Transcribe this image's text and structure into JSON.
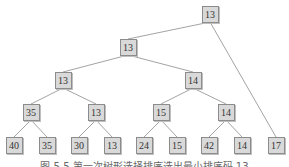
{
  "diagram": {
    "type": "tournament-tree",
    "nodes": [
      {
        "id": "root",
        "label": "13",
        "x": 210,
        "y": 14
      },
      {
        "id": "n1",
        "label": "13",
        "x": 128,
        "y": 47
      },
      {
        "id": "n2",
        "label": "13",
        "x": 63,
        "y": 80
      },
      {
        "id": "n3",
        "label": "14",
        "x": 193,
        "y": 80
      },
      {
        "id": "n4",
        "label": "35",
        "x": 31,
        "y": 112
      },
      {
        "id": "n5",
        "label": "13",
        "x": 96,
        "y": 112
      },
      {
        "id": "n6",
        "label": "15",
        "x": 161,
        "y": 112
      },
      {
        "id": "n7",
        "label": "14",
        "x": 226,
        "y": 112
      },
      {
        "id": "l1",
        "label": "40",
        "x": 14,
        "y": 145
      },
      {
        "id": "l2",
        "label": "35",
        "x": 47,
        "y": 145
      },
      {
        "id": "l3",
        "label": "30",
        "x": 79,
        "y": 145
      },
      {
        "id": "l4",
        "label": "13",
        "x": 112,
        "y": 145
      },
      {
        "id": "l5",
        "label": "24",
        "x": 144,
        "y": 145
      },
      {
        "id": "l6",
        "label": "15",
        "x": 177,
        "y": 145
      },
      {
        "id": "l7",
        "label": "42",
        "x": 209,
        "y": 145
      },
      {
        "id": "l8",
        "label": "14",
        "x": 242,
        "y": 145
      },
      {
        "id": "l9",
        "label": "17",
        "x": 276,
        "y": 145
      }
    ],
    "edges": [
      [
        "root",
        "n1"
      ],
      [
        "root",
        "l9"
      ],
      [
        "n1",
        "n2"
      ],
      [
        "n1",
        "n3"
      ],
      [
        "n2",
        "n4"
      ],
      [
        "n2",
        "n5"
      ],
      [
        "n3",
        "n6"
      ],
      [
        "n3",
        "n7"
      ],
      [
        "n4",
        "l1"
      ],
      [
        "n4",
        "l2"
      ],
      [
        "n5",
        "l3"
      ],
      [
        "n5",
        "l4"
      ],
      [
        "n6",
        "l5"
      ],
      [
        "n6",
        "l6"
      ],
      [
        "n7",
        "l7"
      ],
      [
        "n7",
        "l8"
      ]
    ],
    "colors": {
      "node_fill": "#d9d9d9",
      "node_border": "#8c8c8c",
      "edge": "#8c8c8c"
    }
  },
  "caption": "图 5.5   第一次树形选择排序选出最小排序码 13"
}
